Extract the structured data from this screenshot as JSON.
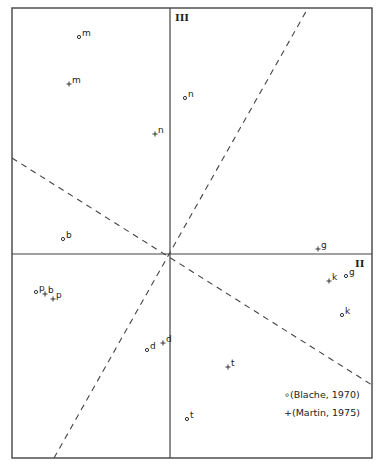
{
  "chart_data": {
    "type": "scatter",
    "title": "",
    "axes": {
      "horizontal": "II",
      "vertical": "III"
    },
    "frame": {
      "left": 12,
      "top": 8,
      "right": 372,
      "bottom": 458
    },
    "origin": {
      "x": 170,
      "y": 254
    },
    "grid": false,
    "legend_position": "bottom-right",
    "dashed_lines": [
      {
        "x1": 12,
        "y1": 158,
        "x2": 372,
        "y2": 385
      },
      {
        "x1": 54,
        "y1": 458,
        "x2": 308,
        "y2": 8
      }
    ],
    "series": [
      {
        "name": "Blache, 1970",
        "marker": "dot",
        "points": [
          {
            "label": "m",
            "x": 79,
            "y": 37
          },
          {
            "label": "n",
            "x": 185,
            "y": 98
          },
          {
            "label": "b",
            "x": 63,
            "y": 239
          },
          {
            "label": "p",
            "x": 36,
            "y": 292
          },
          {
            "label": "g",
            "x": 346,
            "y": 276
          },
          {
            "label": "k",
            "x": 342,
            "y": 315
          },
          {
            "label": "d",
            "x": 147,
            "y": 350
          },
          {
            "label": "t",
            "x": 187,
            "y": 419
          }
        ]
      },
      {
        "name": "Martin, 1975",
        "marker": "plus",
        "points": [
          {
            "label": "m",
            "x": 69,
            "y": 84
          },
          {
            "label": "n",
            "x": 155,
            "y": 134
          },
          {
            "label": "b",
            "x": 45,
            "y": 294
          },
          {
            "label": "p",
            "x": 53,
            "y": 299
          },
          {
            "label": "g",
            "x": 318,
            "y": 249
          },
          {
            "label": "k",
            "x": 329,
            "y": 281
          },
          {
            "label": "d",
            "x": 163,
            "y": 343
          },
          {
            "label": "t",
            "x": 228,
            "y": 367
          }
        ]
      }
    ],
    "legend": [
      {
        "marker": "dot",
        "text": "∘(Blache, 1970)"
      },
      {
        "marker": "plus",
        "text": "+(Martin, 1975)"
      }
    ]
  },
  "labels": {
    "axis_vertical": "III",
    "axis_horizontal": "II",
    "legend_1": "∘(Blache, 1970)",
    "legend_2": "+(Martin, 1975)"
  }
}
